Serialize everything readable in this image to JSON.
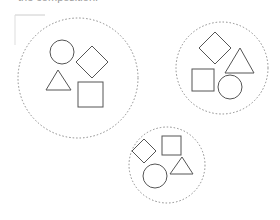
{
  "caption": "the composition.",
  "colors": {
    "stroke": "#555555",
    "group_outline": "#8a8a8a",
    "guide": "#cccccc",
    "background": "#ffffff"
  },
  "groups": [
    {
      "id": "group-left",
      "outline": {
        "cx": 78,
        "cy": 78,
        "r": 60
      },
      "shapes": [
        {
          "type": "circle",
          "cx": 62,
          "cy": 52,
          "r": 12
        },
        {
          "type": "diamond",
          "cx": 92,
          "cy": 62,
          "half": 16
        },
        {
          "type": "triangle",
          "points": "46,90 71,90 58,70"
        },
        {
          "type": "square",
          "x": 78,
          "y": 82,
          "size": 25
        }
      ]
    },
    {
      "id": "group-right",
      "outline": {
        "cx": 222,
        "cy": 68,
        "r": 46
      },
      "shapes": [
        {
          "type": "diamond",
          "cx": 215,
          "cy": 48,
          "half": 16
        },
        {
          "type": "triangle",
          "points": "225,73 254,73 240,48"
        },
        {
          "type": "square",
          "x": 192,
          "y": 69,
          "size": 22
        },
        {
          "type": "circle",
          "cx": 230,
          "cy": 87,
          "r": 12
        }
      ]
    },
    {
      "id": "group-bottom",
      "outline": {
        "cx": 167,
        "cy": 165,
        "r": 38
      },
      "shapes": [
        {
          "type": "diamond",
          "cx": 144,
          "cy": 151,
          "half": 12
        },
        {
          "type": "square",
          "x": 162,
          "y": 136,
          "size": 19
        },
        {
          "type": "circle",
          "cx": 155,
          "cy": 176,
          "r": 12
        },
        {
          "type": "triangle",
          "points": "170,174 193,174 182,157"
        }
      ]
    }
  ]
}
